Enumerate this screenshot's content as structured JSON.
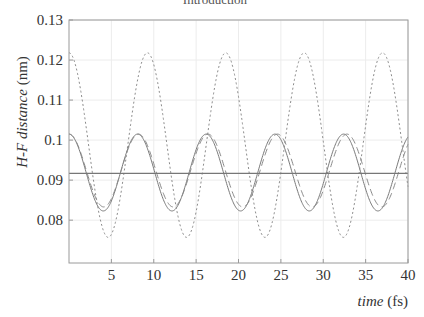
{
  "chart_data": {
    "type": "line",
    "title": "Introduction",
    "xlabel": "time (fs)",
    "xlabel_italic": "time",
    "xlabel_unit": "(fs)",
    "ylabel": "H-F distance (nm)",
    "ylabel_italic": "H-F distance",
    "ylabel_unit": "(nm)",
    "xlim": [
      0,
      40
    ],
    "ylim": [
      0.0693,
      0.13
    ],
    "xticks": [
      5,
      10,
      15,
      20,
      25,
      30,
      35,
      40
    ],
    "xtick_labels": [
      "5",
      "10",
      "15",
      "20",
      "25",
      "30",
      "35",
      "40"
    ],
    "yticks": [
      0.08,
      0.09,
      0.1,
      0.11,
      0.12,
      0.13
    ],
    "ytick_labels": [
      "0.08",
      "0.09",
      "0.1",
      "0.11",
      "0.12",
      "0.13"
    ],
    "grid": true,
    "legend": null,
    "series": [
      {
        "name": "solid oscillation",
        "style": "solid",
        "color": "#7a7a7a",
        "model": "cosine",
        "mean": 0.0919,
        "amplitude": 0.0096,
        "period_fs": 8.1,
        "phase_fs": 0.0,
        "peaks": [
          [
            0,
            0.1015
          ],
          [
            7.9,
            0.1015
          ],
          [
            16.0,
            0.1015
          ],
          [
            24.1,
            0.1015
          ],
          [
            32.2,
            0.1015
          ],
          [
            40.0,
            0.1013
          ]
        ],
        "troughs": [
          [
            4.0,
            0.0823
          ],
          [
            12.1,
            0.0823
          ],
          [
            20.1,
            0.0823
          ],
          [
            28.2,
            0.0823
          ],
          [
            36.3,
            0.0823
          ]
        ]
      },
      {
        "name": "dashed oscillation",
        "style": "dashed",
        "color": "#8a8a8a",
        "model": "cosine",
        "mean": 0.0924,
        "amplitude": 0.0091,
        "period_fs": 8.2,
        "phase_fs": 0.0,
        "peaks": [
          [
            0,
            0.1015
          ],
          [
            8.0,
            0.1015
          ],
          [
            16.3,
            0.1015
          ],
          [
            24.6,
            0.1015
          ],
          [
            32.6,
            0.1015
          ]
        ],
        "troughs": [
          [
            4.2,
            0.0832
          ],
          [
            12.4,
            0.0832
          ],
          [
            20.6,
            0.0832
          ],
          [
            28.8,
            0.0832
          ],
          [
            36.9,
            0.0832
          ]
        ]
      },
      {
        "name": "dotted oscillation",
        "style": "dotted",
        "color": "#8c8c8c",
        "model": "cosine",
        "mean": 0.09875,
        "amplitude": 0.02305,
        "period_fs": 9.25,
        "phase_fs": 0.0,
        "peaks": [
          [
            0,
            0.1218
          ],
          [
            9.3,
            0.1218
          ],
          [
            18.5,
            0.1218
          ],
          [
            27.7,
            0.1218
          ],
          [
            36.9,
            0.1218
          ]
        ],
        "troughs": [
          [
            4.6,
            0.0757
          ],
          [
            13.9,
            0.0757
          ],
          [
            23.1,
            0.0757
          ],
          [
            32.3,
            0.0757
          ]
        ]
      },
      {
        "name": "equilibrium distance",
        "style": "solid-flat",
        "color": "#777777",
        "model": "constant",
        "value": 0.0917
      }
    ]
  },
  "colors": {
    "axis": "#9a9a9a",
    "grid": "#ececec",
    "text": "#333333"
  }
}
